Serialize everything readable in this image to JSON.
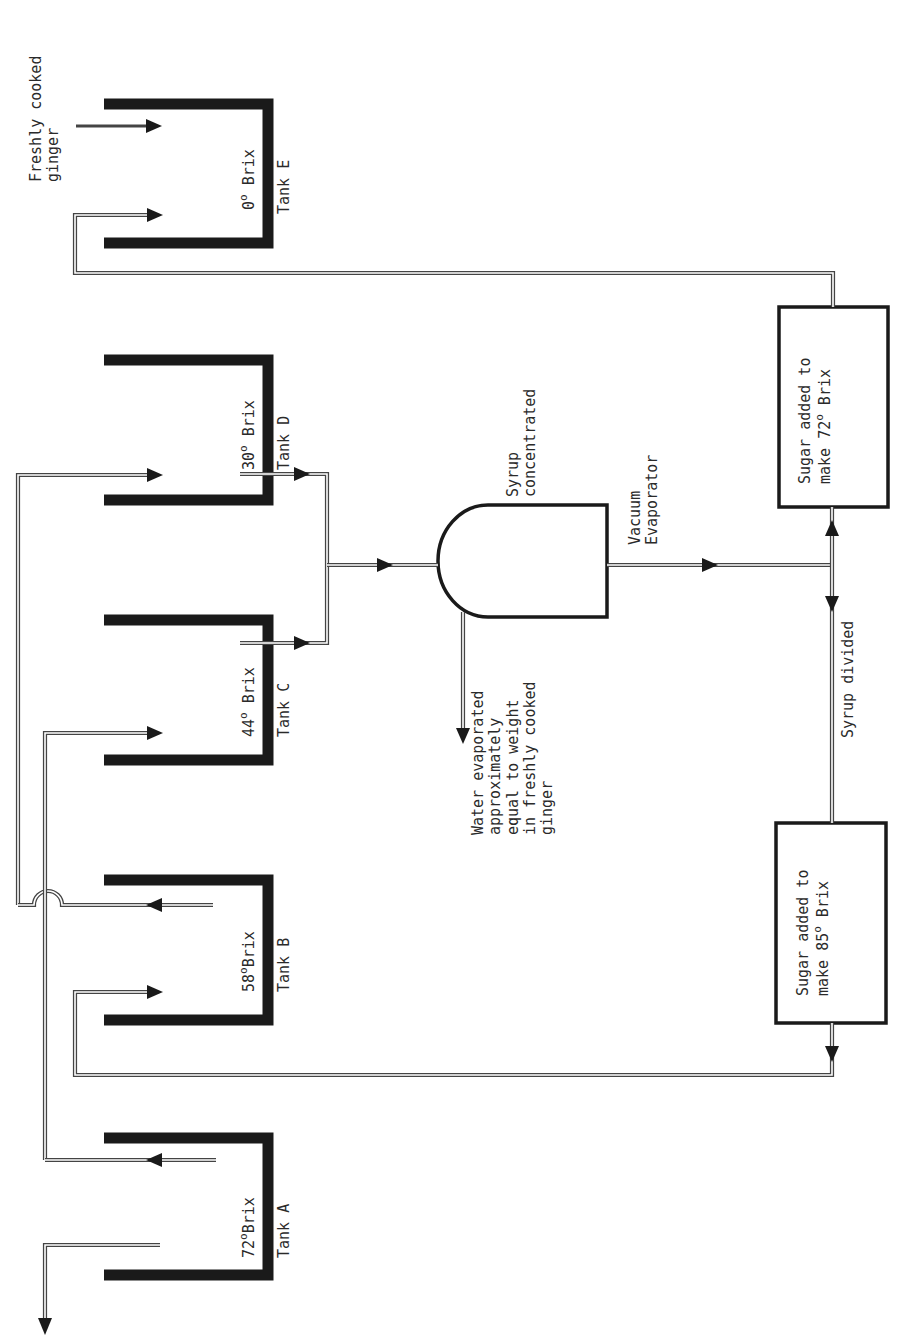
{
  "tanks": [
    {
      "id": "A",
      "label": "Tank A",
      "brix_value": "72",
      "brix_unit": "Brix"
    },
    {
      "id": "B",
      "label": "Tank B",
      "brix_value": "58",
      "brix_unit": "Brix"
    },
    {
      "id": "C",
      "label": "Tank C",
      "brix_value": "44",
      "brix_unit": "Brix"
    },
    {
      "id": "D",
      "label": "Tank D",
      "brix_value": "30",
      "brix_unit": "Brix"
    },
    {
      "id": "E",
      "label": "Tank E",
      "brix_value": "0",
      "brix_unit": "Brix"
    }
  ],
  "input": {
    "line1": "Freshly cooked",
    "line2": "ginger"
  },
  "evaporator": {
    "name_line1": "Vacuum",
    "name_line2": "Evaporator",
    "note_line1": "Syrup",
    "note_line2": "concentrated"
  },
  "water_note": {
    "lines": [
      "Water evaporated",
      "approximately",
      "equal to weight",
      "in freshly cooked",
      "ginger"
    ]
  },
  "divider_label": "Syrup divided",
  "sugar_boxes": [
    {
      "id": "box72",
      "line1": "Sugar added to",
      "line2_prefix": "make ",
      "value": "72",
      "line2_suffix": " Brix"
    },
    {
      "id": "box85",
      "line1": "Sugar added to",
      "line2_prefix": "make ",
      "value": "85",
      "line2_suffix": " Brix"
    }
  ],
  "degree_symbol": "o",
  "colors": {
    "ink": "#1a1a1a",
    "pipe": "#444444",
    "background": "#ffffff"
  }
}
